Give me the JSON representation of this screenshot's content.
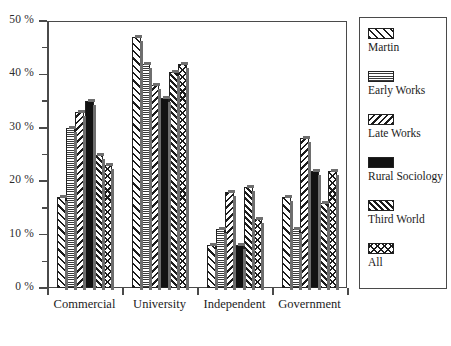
{
  "chart_data": {
    "type": "bar",
    "title": "",
    "xlabel": "",
    "ylabel": "",
    "ylim": [
      0,
      50
    ],
    "ytick_labels": [
      "0 %",
      "10 %",
      "20 %",
      "30 %",
      "40 %",
      "50 %"
    ],
    "ytick_values": [
      0,
      10,
      20,
      30,
      40,
      50
    ],
    "yminor_values": [
      5,
      15,
      25,
      35,
      45
    ],
    "grid": false,
    "legend_position": "right",
    "categories": [
      "Commercial",
      "University",
      "Independent",
      "Government"
    ],
    "series": [
      {
        "name": "Martin",
        "pattern": "forward-hatch-wide",
        "values": [
          17,
          47,
          8,
          17
        ]
      },
      {
        "name": "Early Works",
        "pattern": "dotted-stipple",
        "values": [
          30,
          42,
          11,
          11
        ]
      },
      {
        "name": "Late Works",
        "pattern": "backward-hatch",
        "values": [
          33,
          38,
          18,
          28
        ]
      },
      {
        "name": "Rural Sociology",
        "pattern": "solid-black",
        "values": [
          35,
          35.5,
          8,
          22
        ]
      },
      {
        "name": "Third World",
        "pattern": "forward-hatch-dense",
        "values": [
          25,
          40.5,
          19,
          16
        ]
      },
      {
        "name": "All",
        "pattern": "cross-hatch",
        "values": [
          23,
          42,
          13,
          22
        ]
      }
    ]
  },
  "legend": {
    "entries": [
      {
        "label": "Martin"
      },
      {
        "label": "Early Works"
      },
      {
        "label": "Late Works"
      },
      {
        "label": "Rural Sociology"
      },
      {
        "label": "Third World"
      },
      {
        "label": "All"
      }
    ]
  },
  "colors": {
    "ink": "#1c1c1c",
    "axis": "#4a4a4a",
    "shadow": "#6e6e6e",
    "background": "#ffffff"
  }
}
